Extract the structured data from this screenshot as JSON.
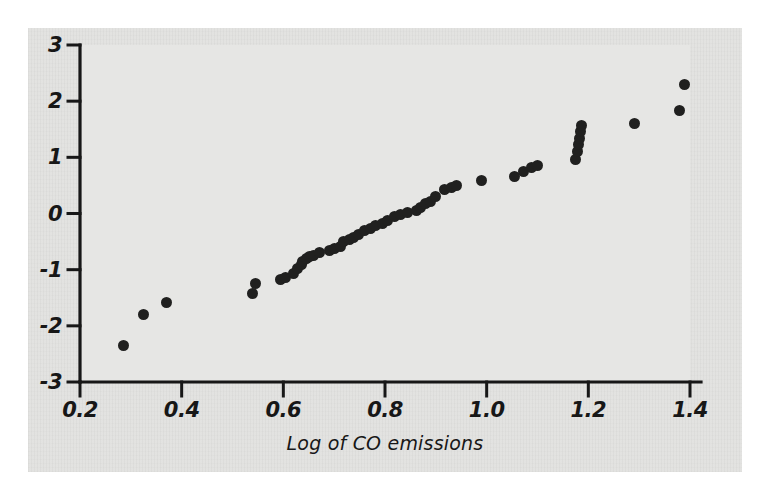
{
  "figure": {
    "background_color": "#ffffff",
    "panel_color": "#e2e2e0",
    "plot_area_color": "#e6e6e4",
    "axis_color": "#171717",
    "marker_color": "#20201f"
  },
  "chart_data": {
    "type": "scatter",
    "title": "",
    "subtitle": "",
    "xlabel": "Log of CO emissions",
    "ylabel": "",
    "xlim": [
      0.2,
      1.4
    ],
    "ylim": [
      -3,
      3
    ],
    "xticks": [
      0.2,
      0.4,
      0.6,
      0.8,
      1.0,
      1.2,
      1.4
    ],
    "xticklabels": [
      "0.2",
      "0.4",
      "0.6",
      "0.8",
      "1.0",
      "1.2",
      "1.4"
    ],
    "yticks": [
      3,
      2,
      1,
      0,
      -1,
      -2,
      -3
    ],
    "yticklabels": [
      "3",
      "2",
      "1",
      "0",
      "-1",
      "-2",
      "-3"
    ],
    "grid": false,
    "legend": null,
    "annotations": [],
    "marker": "filled-circle",
    "n_points": 52,
    "x": [
      0.285,
      0.325,
      0.37,
      0.54,
      0.545,
      0.595,
      0.605,
      0.62,
      0.628,
      0.635,
      0.638,
      0.645,
      0.652,
      0.66,
      0.672,
      0.69,
      0.7,
      0.712,
      0.718,
      0.73,
      0.738,
      0.748,
      0.76,
      0.772,
      0.782,
      0.795,
      0.805,
      0.818,
      0.83,
      0.845,
      0.862,
      0.87,
      0.88,
      0.89,
      0.9,
      0.918,
      0.93,
      0.94,
      0.99,
      1.055,
      1.072,
      1.088,
      1.1,
      1.175,
      1.178,
      1.18,
      1.182,
      1.184,
      1.186,
      1.29,
      1.38,
      1.39
    ],
    "y": [
      -2.35,
      -1.8,
      -1.58,
      -1.42,
      -1.25,
      -1.18,
      -1.14,
      -1.06,
      -0.98,
      -0.9,
      -0.86,
      -0.8,
      -0.76,
      -0.74,
      -0.7,
      -0.66,
      -0.62,
      -0.58,
      -0.5,
      -0.46,
      -0.42,
      -0.38,
      -0.3,
      -0.26,
      -0.22,
      -0.18,
      -0.12,
      -0.06,
      -0.02,
      0.02,
      0.06,
      0.1,
      0.18,
      0.22,
      0.3,
      0.42,
      0.46,
      0.5,
      0.58,
      0.66,
      0.74,
      0.82,
      0.86,
      0.96,
      1.1,
      1.22,
      1.34,
      1.46,
      1.56,
      1.6,
      1.84,
      2.3
    ]
  }
}
